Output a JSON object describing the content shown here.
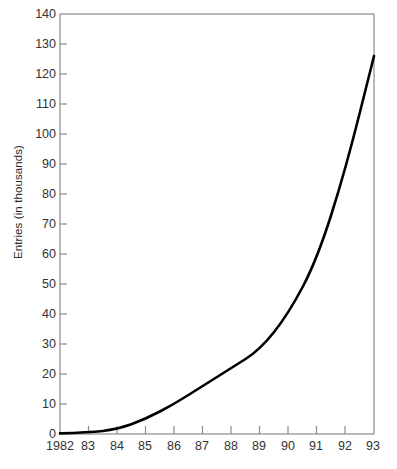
{
  "chart_data": {
    "type": "line",
    "title": "",
    "xlabel": "",
    "ylabel": "Entries (in thousands)",
    "x": [
      1982,
      1983,
      1984,
      1985,
      1986,
      1987,
      1988,
      1989,
      1990,
      1991,
      1992,
      1993
    ],
    "xtick_labels": [
      "1982",
      "83",
      "84",
      "85",
      "86",
      "87",
      "88",
      "89",
      "90",
      "91",
      "92",
      "93"
    ],
    "values": [
      0.2,
      0.5,
      1.5,
      5,
      10,
      16,
      22,
      28,
      40,
      58,
      88,
      126
    ],
    "series": [
      {
        "name": "Entries",
        "values": [
          0.2,
          0.5,
          1.5,
          5,
          10,
          16,
          22,
          28,
          40,
          58,
          88,
          126
        ]
      }
    ],
    "ylim": [
      0,
      140
    ],
    "xlim": [
      1982,
      1993
    ],
    "ytick_values": [
      0,
      10,
      20,
      30,
      40,
      50,
      60,
      70,
      80,
      90,
      100,
      110,
      120,
      130,
      140
    ],
    "ytick_labels": [
      "0",
      "10",
      "20",
      "30",
      "40",
      "50",
      "60",
      "70",
      "80",
      "90",
      "100",
      "110",
      "120",
      "130",
      "140"
    ],
    "grid": false,
    "legend": false,
    "legend_position": "none",
    "line_color": "#000000",
    "axis_color": "#808080",
    "background_color": "#ffffff"
  },
  "caption": {
    "text": ""
  }
}
